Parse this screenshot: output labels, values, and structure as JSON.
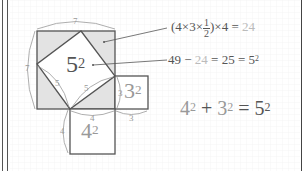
{
  "diagram": {
    "colors": {
      "line": "#555555",
      "shade": "#e3e3e3",
      "grid": "#ececec",
      "label": "#999999",
      "highlight": "#bbbbbb"
    },
    "labels": {
      "big_top": "7",
      "big_left": "7",
      "hyp_a": "5",
      "hyp_b": "5",
      "leg_4_bottom": "4",
      "leg_4_side": "4",
      "leg_3_side": "3",
      "leg_3_bottom": "3"
    },
    "squares": {
      "c": {
        "base": "5",
        "exp": "2"
      },
      "a": {
        "base": "3",
        "exp": "2"
      },
      "b": {
        "base": "4",
        "exp": "2"
      }
    },
    "equation1": {
      "open": "(4×3×",
      "frac_num": "1",
      "frac_den": "2",
      "close": ")×4 =",
      "result": "24"
    },
    "equation2": {
      "left": "49 −",
      "sub": "24",
      "right": "= 25 = 5",
      "exp": "2"
    },
    "main_equation": {
      "a": "4",
      "a_exp": "2",
      "plus": "+",
      "b": "3",
      "b_exp": "2",
      "eq": "=",
      "c": "5",
      "c_exp": "2"
    }
  }
}
